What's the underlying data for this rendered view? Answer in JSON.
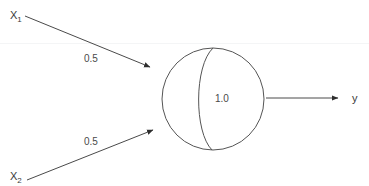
{
  "diagram": {
    "background_color": "#ffffff",
    "stroke_color": "#4a4a4a",
    "text_color": "#3a3a3a",
    "inputs": [
      {
        "id": "x1",
        "label_base": "X",
        "label_sub": "1",
        "weight": "0.5",
        "position": {
          "x": 12,
          "y": 18
        },
        "weight_position": {
          "x": 84,
          "y": 60
        },
        "line": {
          "x1": 25,
          "y1": 16,
          "x2": 152,
          "y2": 68
        }
      },
      {
        "id": "x2",
        "label_base": "X",
        "label_sub": "2",
        "weight": "0.5",
        "position": {
          "x": 12,
          "y": 180
        },
        "weight_position": {
          "x": 84,
          "y": 143
        },
        "line": {
          "x1": 27,
          "y1": 180,
          "x2": 155,
          "y2": 129
        }
      }
    ],
    "neuron": {
      "id": "neuron-1",
      "bias": "1.0",
      "center": {
        "x": 213,
        "y": 99
      },
      "radius": 51,
      "bias_position": {
        "x": 222,
        "y": 102
      }
    },
    "output": {
      "id": "y",
      "label": "y",
      "label_position": {
        "x": 353,
        "y": 102
      },
      "line": {
        "x1": 266,
        "y1": 98,
        "x2": 341,
        "y2": 98
      }
    }
  }
}
